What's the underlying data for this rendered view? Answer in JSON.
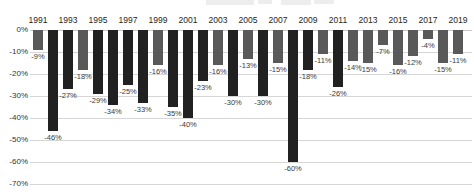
{
  "chart_data": {
    "type": "bar",
    "title": "",
    "x": [
      1991,
      1992,
      1993,
      1994,
      1995,
      1996,
      1997,
      1998,
      1999,
      2000,
      2001,
      2002,
      2003,
      2004,
      2005,
      2006,
      2007,
      2008,
      2009,
      2010,
      2011,
      2012,
      2013,
      2014,
      2015,
      2016,
      2017,
      2018,
      2019
    ],
    "values": [
      -9,
      -46,
      -27,
      -18,
      -29,
      -34,
      -25,
      -33,
      -16,
      -35,
      -40,
      -23,
      -16,
      -30,
      -13,
      -30,
      -15,
      -60,
      -18,
      -11,
      -26,
      -14,
      -15,
      -7,
      -16,
      -12,
      -4,
      -15,
      -11
    ],
    "bar_styles": [
      "gray",
      "dark",
      "dark",
      "gray",
      "dark",
      "dark",
      "dark",
      "dark",
      "gray",
      "dark",
      "dark",
      "dark",
      "gray",
      "dark",
      "gray",
      "dark",
      "gray",
      "dark",
      "dark",
      "gray",
      "dark",
      "gray",
      "gray",
      "gray",
      "gray",
      "gray",
      "gray",
      "gray",
      "gray"
    ],
    "data_labels": [
      "-9%",
      "-46%",
      "-27%",
      "-18%",
      "-29%",
      "-34%",
      "-25%",
      "-33%",
      "-16%",
      "-35%",
      "-40%",
      "-23%",
      "-16%",
      "-30%",
      "-13%",
      "-30%",
      "-15%",
      "-60%",
      "-18%",
      "-11%",
      "-26%",
      "-14%",
      "-15%",
      "-7%",
      "-16%",
      "-12%",
      "-4%",
      "-15%",
      "-11%"
    ],
    "x_tick_labels": [
      "1991",
      "1993",
      "1995",
      "1997",
      "1999",
      "2001",
      "2003",
      "2005",
      "2007",
      "2009",
      "2011",
      "2013",
      "2015",
      "2017",
      "2019"
    ],
    "y_tick_labels": [
      "0%",
      "-10%",
      "-20%",
      "-30%",
      "-40%",
      "-50%",
      "-60%",
      "-70%"
    ],
    "ylim": [
      -70,
      0
    ],
    "grid": true,
    "legend": null
  },
  "style": {
    "dark_bar_color": "#212121",
    "gray_bar_color": "#595959",
    "gridline_color": "#d6d6d6",
    "zero_line_color": "#c9c9c9",
    "y_tick_color": "#333333",
    "year_label_color": "#262626",
    "data_label_color": "#3a3a3a",
    "background": "#ffffff"
  }
}
